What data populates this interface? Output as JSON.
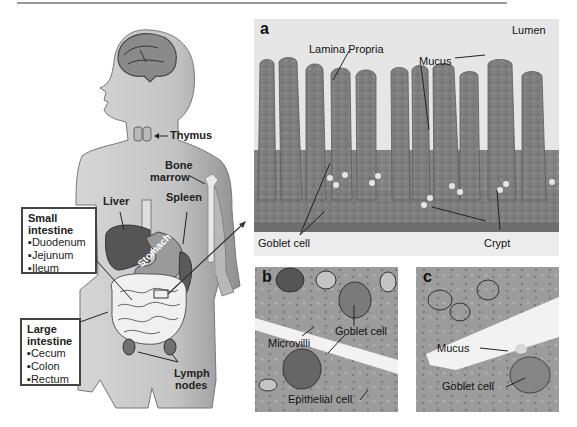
{
  "figure": {
    "body_diagram": {
      "organs": {
        "thymus": "Thymus",
        "bone_marrow": [
          "Bone",
          "marrow"
        ],
        "liver": "Liver",
        "spleen": "Spleen",
        "stomach": "Stomach",
        "lymph_nodes": [
          "Lymph",
          "nodes"
        ]
      },
      "small_intestine_box": {
        "title": [
          "Small",
          "intestine"
        ],
        "items": [
          "▪Duodenum",
          "▪Jejunum",
          "▪Ileum"
        ]
      },
      "large_intestine_box": {
        "title": [
          "Large",
          "intestine"
        ],
        "items": [
          "▪Cecum",
          "▪Colon",
          "▪Rectum"
        ]
      }
    },
    "panel_a": {
      "letter": "a",
      "labels": {
        "lumen": "Lumen",
        "lamina_propria": "Lamina Propria",
        "mucus": "Mucus",
        "goblet_cell": "Goblet cell",
        "crypt": "Crypt"
      }
    },
    "panel_b": {
      "letter": "b",
      "labels": {
        "goblet_cell": "Goblet cell",
        "microvilli": "Microvilli",
        "epithelial_cell": "Epithelial cell"
      }
    },
    "panel_c": {
      "letter": "c",
      "labels": {
        "mucus": "Mucus",
        "goblet_cell": "Goblet cell"
      }
    }
  }
}
